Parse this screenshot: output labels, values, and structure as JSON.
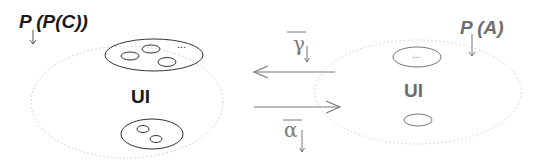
{
  "diagram": {
    "left_domain": {
      "label": "P (P(C))",
      "center_label": "UI",
      "ellipsis": "...",
      "color": "#1a1a1a"
    },
    "right_domain": {
      "label": "P (A)",
      "center_label": "UI",
      "ellipsis": "...",
      "color": "#6e6e6e"
    },
    "arrows": {
      "top": {
        "label": "γ",
        "direction": "right-to-left"
      },
      "bottom": {
        "label": "α",
        "direction": "left-to-right"
      },
      "color": "#7a7a7a"
    }
  }
}
